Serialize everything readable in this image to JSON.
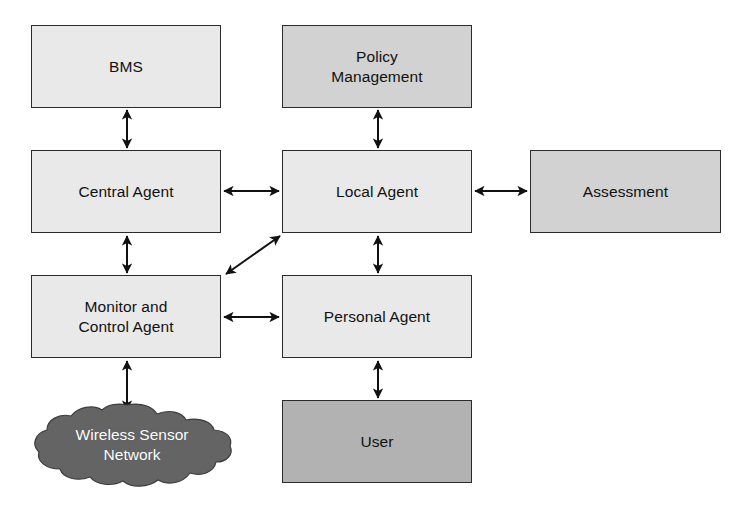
{
  "diagram": {
    "background_color": "#ffffff",
    "line_color": "#111111",
    "nodes": [
      {
        "id": "bms",
        "label": "BMS",
        "shape": "rectangle",
        "fill": "#e9e9e9",
        "x": 31,
        "y": 25,
        "w": 190,
        "h": 83
      },
      {
        "id": "policy-management",
        "label": "Policy\nManagement",
        "shape": "rectangle",
        "fill": "#d2d2d2",
        "x": 282,
        "y": 25,
        "w": 190,
        "h": 83
      },
      {
        "id": "central-agent",
        "label": "Central Agent",
        "shape": "rectangle",
        "fill": "#e9e9e9",
        "x": 31,
        "y": 150,
        "w": 190,
        "h": 83
      },
      {
        "id": "local-agent",
        "label": "Local Agent",
        "shape": "rectangle",
        "fill": "#e9e9e9",
        "x": 282,
        "y": 150,
        "w": 190,
        "h": 83
      },
      {
        "id": "assessment",
        "label": "Assessment",
        "shape": "rectangle",
        "fill": "#d2d2d2",
        "x": 530,
        "y": 150,
        "w": 191,
        "h": 83
      },
      {
        "id": "monitor-and-control-agent",
        "label": "Monitor and\nControl Agent",
        "shape": "rectangle",
        "fill": "#e9e9e9",
        "x": 31,
        "y": 275,
        "w": 190,
        "h": 83
      },
      {
        "id": "personal-agent",
        "label": "Personal Agent",
        "shape": "rectangle",
        "fill": "#e9e9e9",
        "x": 282,
        "y": 275,
        "w": 190,
        "h": 83
      },
      {
        "id": "user",
        "label": "User",
        "shape": "rectangle",
        "fill": "#b2b2b2",
        "x": 282,
        "y": 400,
        "w": 190,
        "h": 83
      },
      {
        "id": "wireless-sensor-network",
        "label": "Wireless Sensor\nNetwork",
        "shape": "cloud",
        "fill": "#646464",
        "text_color": "#ffffff",
        "x": 30,
        "y": 402,
        "w": 204,
        "h": 86
      }
    ],
    "connectors": [
      {
        "id": "bms-central-agent",
        "from": "bms",
        "to": "central-agent",
        "orientation": "vertical",
        "arrows": "double"
      },
      {
        "id": "policy-local-agent",
        "from": "policy-management",
        "to": "local-agent",
        "orientation": "vertical",
        "arrows": "double"
      },
      {
        "id": "central-local-agent",
        "from": "central-agent",
        "to": "local-agent",
        "orientation": "horizontal",
        "arrows": "double"
      },
      {
        "id": "local-agent-assessment",
        "from": "local-agent",
        "to": "assessment",
        "orientation": "horizontal",
        "arrows": "double"
      },
      {
        "id": "central-monitor-agent",
        "from": "central-agent",
        "to": "monitor-and-control-agent",
        "orientation": "vertical",
        "arrows": "double"
      },
      {
        "id": "local-agent-personal-agent",
        "from": "local-agent",
        "to": "personal-agent",
        "orientation": "vertical",
        "arrows": "double"
      },
      {
        "id": "monitor-agent-local-agent",
        "from": "monitor-and-control-agent",
        "to": "local-agent",
        "orientation": "diagonal",
        "arrows": "double"
      },
      {
        "id": "monitor-agent-personal-agent",
        "from": "monitor-and-control-agent",
        "to": "personal-agent",
        "orientation": "horizontal",
        "arrows": "double"
      },
      {
        "id": "monitor-agent-wsn",
        "from": "monitor-and-control-agent",
        "to": "wireless-sensor-network",
        "orientation": "vertical",
        "arrows": "double"
      },
      {
        "id": "personal-agent-user",
        "from": "personal-agent",
        "to": "user",
        "orientation": "vertical",
        "arrows": "double"
      }
    ]
  }
}
